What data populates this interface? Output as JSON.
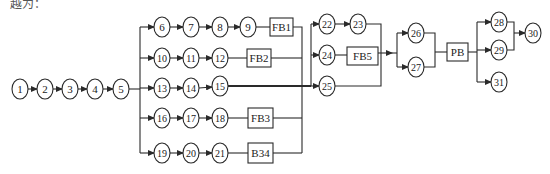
{
  "caption": "越为：",
  "colors": {
    "stroke": "#2a2a2a",
    "background": "#ffffff",
    "text": "#222222"
  },
  "nodes": [
    {
      "id": "n1",
      "label": "1",
      "x": 20,
      "y": 89
    },
    {
      "id": "n2",
      "label": "2",
      "x": 45,
      "y": 89
    },
    {
      "id": "n3",
      "label": "3",
      "x": 70,
      "y": 89
    },
    {
      "id": "n4",
      "label": "4",
      "x": 95,
      "y": 89
    },
    {
      "id": "n5",
      "label": "5",
      "x": 121,
      "y": 89
    },
    {
      "id": "n6",
      "label": "6",
      "x": 162,
      "y": 27
    },
    {
      "id": "n7",
      "label": "7",
      "x": 191,
      "y": 27
    },
    {
      "id": "n8",
      "label": "8",
      "x": 220,
      "y": 27
    },
    {
      "id": "n9",
      "label": "9",
      "x": 248,
      "y": 27
    },
    {
      "id": "n10",
      "label": "10",
      "x": 162,
      "y": 58
    },
    {
      "id": "n11",
      "label": "11",
      "x": 191,
      "y": 58
    },
    {
      "id": "n12",
      "label": "12",
      "x": 220,
      "y": 58
    },
    {
      "id": "n13",
      "label": "13",
      "x": 162,
      "y": 88
    },
    {
      "id": "n14",
      "label": "14",
      "x": 191,
      "y": 88
    },
    {
      "id": "n15",
      "label": "15",
      "x": 220,
      "y": 86
    },
    {
      "id": "n16",
      "label": "16",
      "x": 162,
      "y": 118
    },
    {
      "id": "n17",
      "label": "17",
      "x": 191,
      "y": 118
    },
    {
      "id": "n18",
      "label": "18",
      "x": 220,
      "y": 118
    },
    {
      "id": "n19",
      "label": "19",
      "x": 162,
      "y": 153
    },
    {
      "id": "n20",
      "label": "20",
      "x": 191,
      "y": 153
    },
    {
      "id": "n21",
      "label": "21",
      "x": 220,
      "y": 153
    },
    {
      "id": "n22",
      "label": "22",
      "x": 327,
      "y": 24
    },
    {
      "id": "n23",
      "label": "23",
      "x": 358,
      "y": 24
    },
    {
      "id": "n24",
      "label": "24",
      "x": 327,
      "y": 55
    },
    {
      "id": "n25",
      "label": "25",
      "x": 327,
      "y": 86
    },
    {
      "id": "n26",
      "label": "26",
      "x": 416,
      "y": 33
    },
    {
      "id": "n27",
      "label": "27",
      "x": 416,
      "y": 67
    },
    {
      "id": "n28",
      "label": "28",
      "x": 499,
      "y": 22
    },
    {
      "id": "n29",
      "label": "29",
      "x": 499,
      "y": 50
    },
    {
      "id": "n30",
      "label": "30",
      "x": 533,
      "y": 33
    },
    {
      "id": "n31",
      "label": "31",
      "x": 499,
      "y": 82
    }
  ],
  "boxes": [
    {
      "id": "fb1",
      "label": "FB1",
      "x": 270,
      "y": 18,
      "w": 23,
      "h": 18
    },
    {
      "id": "fb2",
      "label": "FB2",
      "x": 247,
      "y": 49,
      "w": 24,
      "h": 18
    },
    {
      "id": "fb3",
      "label": "FB3",
      "x": 248,
      "y": 108,
      "w": 25,
      "h": 20
    },
    {
      "id": "b34",
      "label": "B34",
      "x": 248,
      "y": 143,
      "w": 25,
      "h": 20
    },
    {
      "id": "fb5",
      "label": "FB5",
      "x": 347,
      "y": 47,
      "w": 31,
      "h": 18
    },
    {
      "id": "pb",
      "label": "PB",
      "x": 447,
      "y": 43,
      "w": 21,
      "h": 18
    }
  ],
  "arrows": [
    {
      "from": [
        28,
        89
      ],
      "to": [
        37,
        89
      ]
    },
    {
      "from": [
        53,
        89
      ],
      "to": [
        62,
        89
      ]
    },
    {
      "from": [
        78,
        89
      ],
      "to": [
        87,
        89
      ]
    },
    {
      "from": [
        103,
        89
      ],
      "to": [
        113,
        89
      ]
    },
    {
      "from": [
        140,
        27
      ],
      "to": [
        154,
        27
      ]
    },
    {
      "from": [
        170,
        27
      ],
      "to": [
        183,
        27
      ]
    },
    {
      "from": [
        199,
        27
      ],
      "to": [
        212,
        27
      ]
    },
    {
      "from": [
        228,
        27
      ],
      "to": [
        240,
        27
      ]
    },
    {
      "from": [
        140,
        58
      ],
      "to": [
        154,
        58
      ]
    },
    {
      "from": [
        170,
        58
      ],
      "to": [
        183,
        58
      ]
    },
    {
      "from": [
        199,
        58
      ],
      "to": [
        212,
        58
      ]
    },
    {
      "from": [
        140,
        88
      ],
      "to": [
        154,
        88
      ]
    },
    {
      "from": [
        170,
        88
      ],
      "to": [
        183,
        88
      ]
    },
    {
      "from": [
        199,
        88
      ],
      "to": [
        212,
        87
      ]
    },
    {
      "from": [
        140,
        118
      ],
      "to": [
        154,
        118
      ]
    },
    {
      "from": [
        170,
        118
      ],
      "to": [
        183,
        118
      ]
    },
    {
      "from": [
        199,
        118
      ],
      "to": [
        212,
        118
      ]
    },
    {
      "from": [
        140,
        153
      ],
      "to": [
        154,
        153
      ]
    },
    {
      "from": [
        170,
        153
      ],
      "to": [
        183,
        153
      ]
    },
    {
      "from": [
        199,
        153
      ],
      "to": [
        212,
        153
      ]
    },
    {
      "from": [
        311,
        24
      ],
      "to": [
        319,
        24
      ]
    },
    {
      "from": [
        335,
        24
      ],
      "to": [
        350,
        24
      ]
    },
    {
      "from": [
        311,
        55
      ],
      "to": [
        319,
        55
      ]
    },
    {
      "from": [
        311,
        86
      ],
      "to": [
        319,
        86
      ]
    },
    {
      "from": [
        381,
        53
      ],
      "to": [
        392,
        53
      ]
    },
    {
      "from": [
        397,
        33
      ],
      "to": [
        408,
        33
      ]
    },
    {
      "from": [
        397,
        67
      ],
      "to": [
        408,
        67
      ]
    },
    {
      "from": [
        477,
        22
      ],
      "to": [
        491,
        22
      ]
    },
    {
      "from": [
        477,
        50
      ],
      "to": [
        491,
        50
      ]
    },
    {
      "from": [
        477,
        82
      ],
      "to": [
        491,
        82
      ]
    },
    {
      "from": [
        514,
        33
      ],
      "to": [
        525,
        33
      ]
    }
  ],
  "lines": [
    {
      "d": "M129 89 H140"
    },
    {
      "d": "M140 27 V153"
    },
    {
      "d": "M256 27 H270"
    },
    {
      "d": "M228 58 H247"
    },
    {
      "d": "M228 118 H248"
    },
    {
      "d": "M228 153 H248"
    },
    {
      "d": "M293 27 H302 V153"
    },
    {
      "d": "M271 58 H302"
    },
    {
      "d": "M273 118 H302"
    },
    {
      "d": "M273 153 H302"
    },
    {
      "d": "M228 86 H311",
      "thick": true
    },
    {
      "d": "M311 24 V86"
    },
    {
      "d": "M335 55 H347"
    },
    {
      "d": "M366 24 H381 V86 H335"
    },
    {
      "d": "M378 53 H381"
    },
    {
      "d": "M397 33 V67"
    },
    {
      "d": "M392 53 H397"
    },
    {
      "d": "M424 33 H435 V67 H424"
    },
    {
      "d": "M435 52 H447"
    },
    {
      "d": "M468 52 H477"
    },
    {
      "d": "M477 22 V82"
    },
    {
      "d": "M507 22 H514 V50 H507"
    }
  ]
}
